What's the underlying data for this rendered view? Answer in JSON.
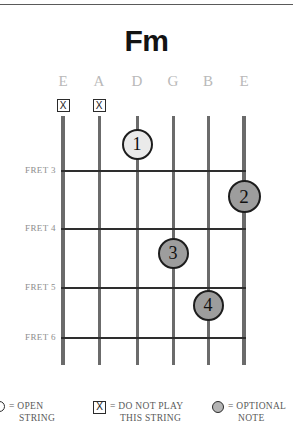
{
  "title": "Fm",
  "divider": {
    "name": "top-rule"
  },
  "strings": [
    {
      "label": "E",
      "x": 63,
      "width": 4,
      "marker": "x"
    },
    {
      "label": "A",
      "x": 99,
      "width": 3,
      "marker": "x"
    },
    {
      "label": "D",
      "x": 137,
      "width": 3,
      "marker": ""
    },
    {
      "label": "G",
      "x": 173,
      "width": 3,
      "marker": ""
    },
    {
      "label": "B",
      "x": 208,
      "width": 3,
      "marker": ""
    },
    {
      "label": "E",
      "x": 244,
      "width": 4,
      "marker": ""
    }
  ],
  "mute_symbol": "X",
  "frets": [
    {
      "label": "FRET 3",
      "y": 170
    },
    {
      "label": "FRET 4",
      "y": 228
    },
    {
      "label": "FRET 5",
      "y": 287
    },
    {
      "label": "FRET 6",
      "y": 337
    }
  ],
  "fingers": [
    {
      "number": "1",
      "x": 137,
      "y": 144,
      "size": 31,
      "style": "light"
    },
    {
      "number": "2",
      "x": 244,
      "y": 196,
      "size": 33,
      "style": "dark"
    },
    {
      "number": "3",
      "x": 173,
      "y": 253,
      "size": 31,
      "style": "dark"
    },
    {
      "number": "4",
      "x": 208,
      "y": 305,
      "size": 31,
      "style": "dark"
    }
  ],
  "legend": [
    {
      "symbol": "open-circle",
      "line1": "= OPEN",
      "line2": "STRING",
      "x": -6
    },
    {
      "symbol": "x-box",
      "line1": "= DO NOT PLAY",
      "line2": "THIS STRING",
      "symbol_text": "X",
      "x": 93
    },
    {
      "symbol": "opt-circle",
      "line1": "= OPTIONAL",
      "line2": "NOTE",
      "x": 212
    }
  ]
}
